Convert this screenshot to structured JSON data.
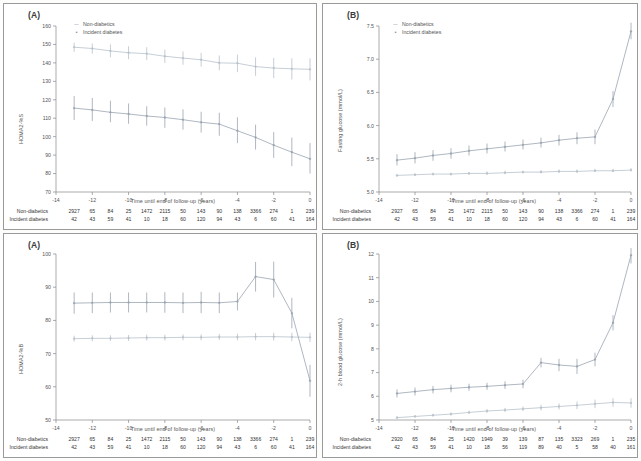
{
  "figure": {
    "legend_labels": [
      "Non-diabetics",
      "Incident diabetes"
    ],
    "xlabel": "Time until end of follow-up (years)",
    "risk_rows": [
      "Non-diabetics",
      "Incident diabetes"
    ],
    "colors": {
      "non_diabetics": "#b8c2cc",
      "incident_diabetes": "#9aa5b1",
      "axis": "#888888"
    }
  },
  "chart_data": [
    {
      "id": "panel-a",
      "type": "line",
      "panel_letter": "(A)",
      "title": "",
      "xlabel": "Time until end of follow-up (years)",
      "ylabel": "HOMA2-%S",
      "xlim": [
        -14,
        0
      ],
      "ylim": [
        70,
        160
      ],
      "yticks": [
        70,
        80,
        90,
        100,
        110,
        120,
        130,
        140,
        150,
        160
      ],
      "xticks": [
        -14,
        -12,
        -10,
        -8,
        -6,
        -4,
        -2,
        0
      ],
      "x": [
        -13,
        -12,
        -11,
        -10,
        -9,
        -8,
        -7,
        -6,
        -5,
        -4,
        -3,
        -2,
        -1,
        0
      ],
      "grid": false,
      "legend_position": "top-left",
      "series": [
        {
          "name": "Non-diabetics",
          "values": [
            148.5,
            147.8,
            146.5,
            145.5,
            145.0,
            143.6,
            142.6,
            141.7,
            140.0,
            139.8,
            138.0,
            137.2,
            136.8,
            136.5
          ],
          "lower": [
            146.0,
            145.0,
            143.0,
            142.0,
            141.5,
            140.0,
            139.0,
            138.0,
            136.0,
            135.0,
            133.0,
            131.8,
            131.0,
            130.5
          ],
          "upper": [
            151.0,
            150.5,
            150.0,
            149.0,
            148.5,
            147.2,
            146.2,
            145.4,
            144.0,
            144.5,
            143.0,
            142.6,
            142.5,
            142.5
          ]
        },
        {
          "name": "Incident diabetes",
          "values": [
            115.5,
            114.5,
            113.2,
            112.3,
            111.2,
            110.4,
            109.2,
            107.8,
            106.8,
            103.2,
            99.6,
            95.4,
            91.6,
            88.0
          ],
          "lower": [
            109.0,
            108.5,
            107.8,
            107.0,
            106.0,
            104.8,
            103.8,
            102.2,
            100.5,
            96.5,
            93.0,
            88.5,
            84.0,
            80.0
          ],
          "upper": [
            122.0,
            121.0,
            119.5,
            118.0,
            116.5,
            115.8,
            114.8,
            113.5,
            113.0,
            110.5,
            106.5,
            102.5,
            99.5,
            96.5
          ]
        }
      ],
      "risk_table": {
        "rows": [
          {
            "label": "Non-diabetics",
            "values": [
              "2927",
              "65",
              "84",
              "25",
              "1472",
              "2115",
              "50",
              "143",
              "90",
              "138",
              "3366",
              "274",
              "1",
              "239"
            ]
          },
          {
            "label": "Incident diabetes",
            "values": [
              "42",
              "43",
              "59",
              "41",
              "10",
              "18",
              "60",
              "120",
              "94",
              "43",
              "6",
              "60",
              "41",
              "164"
            ]
          }
        ]
      }
    },
    {
      "id": "panel-b",
      "type": "line",
      "panel_letter": "(B)",
      "title": "",
      "xlabel": "Time until end of follow-up (years)",
      "ylabel": "Fasting glucose (mmol/L)",
      "xlim": [
        -14,
        0
      ],
      "ylim": [
        5.0,
        7.5
      ],
      "yticks": [
        5.0,
        5.5,
        6.0,
        6.5,
        7.0,
        7.5
      ],
      "xticks": [
        -14,
        -12,
        -10,
        -8,
        -6,
        -4,
        -2,
        0
      ],
      "x": [
        -13,
        -12,
        -11,
        -10,
        -9,
        -8,
        -7,
        -6,
        -5,
        -4,
        -3,
        -2,
        -1,
        0
      ],
      "grid": false,
      "legend_position": "top-left",
      "series": [
        {
          "name": "Non-diabetics",
          "values": [
            5.25,
            5.26,
            5.27,
            5.27,
            5.28,
            5.28,
            5.29,
            5.3,
            5.3,
            5.31,
            5.31,
            5.32,
            5.32,
            5.33
          ],
          "lower": [
            5.23,
            5.24,
            5.25,
            5.25,
            5.26,
            5.26,
            5.27,
            5.28,
            5.28,
            5.29,
            5.29,
            5.3,
            5.3,
            5.31
          ],
          "upper": [
            5.27,
            5.28,
            5.29,
            5.29,
            5.3,
            5.31,
            5.32,
            5.32,
            5.33,
            5.34,
            5.34,
            5.35,
            5.35,
            5.36
          ]
        },
        {
          "name": "Incident diabetes",
          "values": [
            5.48,
            5.51,
            5.55,
            5.58,
            5.62,
            5.65,
            5.68,
            5.71,
            5.74,
            5.78,
            5.81,
            5.83,
            6.4,
            7.42
          ],
          "lower": [
            5.4,
            5.43,
            5.47,
            5.5,
            5.55,
            5.58,
            5.61,
            5.64,
            5.67,
            5.7,
            5.72,
            5.72,
            6.28,
            7.3
          ],
          "upper": [
            5.57,
            5.6,
            5.63,
            5.66,
            5.7,
            5.73,
            5.76,
            5.79,
            5.82,
            5.86,
            5.9,
            5.94,
            6.52,
            7.55
          ]
        }
      ],
      "risk_table": {
        "rows": [
          {
            "label": "Non-diabetics",
            "values": [
              "2927",
              "65",
              "84",
              "25",
              "1472",
              "2115",
              "50",
              "143",
              "90",
              "138",
              "3366",
              "274",
              "1",
              "239"
            ]
          },
          {
            "label": "Incident diabetes",
            "values": [
              "42",
              "43",
              "59",
              "41",
              "10",
              "18",
              "60",
              "120",
              "94",
              "43",
              "6",
              "60",
              "41",
              "164"
            ]
          }
        ]
      }
    },
    {
      "id": "panel-c",
      "type": "line",
      "panel_letter": "(A)",
      "title": "",
      "xlabel": "Time until end of follow-up (years)",
      "ylabel": "HOMA2-%B",
      "xlim": [
        -14,
        0
      ],
      "ylim": [
        50,
        100
      ],
      "yticks": [
        50,
        60,
        70,
        80,
        90,
        100
      ],
      "xticks": [
        -14,
        -12,
        -10,
        -8,
        -6,
        -4,
        -2,
        0
      ],
      "x": [
        -13,
        -12,
        -11,
        -10,
        -9,
        -8,
        -7,
        -6,
        -5,
        -4,
        -3,
        -2,
        -1,
        0
      ],
      "grid": false,
      "legend_position": "none",
      "series": [
        {
          "name": "Non-diabetics",
          "values": [
            74.5,
            74.6,
            74.6,
            74.7,
            74.8,
            74.8,
            74.9,
            74.9,
            75.0,
            75.0,
            75.1,
            75.1,
            75.0,
            74.9
          ],
          "lower": [
            73.6,
            73.7,
            73.8,
            73.8,
            73.9,
            73.9,
            74.0,
            74.0,
            74.1,
            74.0,
            74.0,
            73.9,
            73.7,
            73.5
          ],
          "upper": [
            75.4,
            75.5,
            75.5,
            75.6,
            75.7,
            75.7,
            75.8,
            75.8,
            75.9,
            76.0,
            76.2,
            76.3,
            76.3,
            76.3
          ]
        },
        {
          "name": "Incident diabetes",
          "values": [
            85.2,
            85.3,
            85.4,
            85.4,
            85.4,
            85.4,
            85.3,
            85.4,
            85.3,
            85.7,
            93.2,
            92.3,
            82.2,
            61.8
          ],
          "lower": [
            82.0,
            82.2,
            82.4,
            82.4,
            82.4,
            82.3,
            82.2,
            82.2,
            82.2,
            83.0,
            88.7,
            86.9,
            77.6,
            57.0
          ],
          "upper": [
            88.4,
            88.4,
            88.4,
            88.4,
            88.4,
            88.5,
            88.4,
            88.6,
            88.4,
            88.4,
            97.6,
            97.7,
            86.8,
            66.6
          ]
        }
      ],
      "risk_table": {
        "rows": [
          {
            "label": "Non-diabetics",
            "values": [
              "2927",
              "65",
              "84",
              "25",
              "1472",
              "2115",
              "50",
              "143",
              "90",
              "138",
              "3366",
              "274",
              "1",
              "239"
            ]
          },
          {
            "label": "Incident diabetes",
            "values": [
              "42",
              "43",
              "59",
              "41",
              "10",
              "18",
              "60",
              "120",
              "94",
              "43",
              "6",
              "60",
              "41",
              "164"
            ]
          }
        ]
      }
    },
    {
      "id": "panel-d",
      "type": "line",
      "panel_letter": "(B)",
      "title": "",
      "xlabel": "Time until end of follow-up (years)",
      "ylabel": "2-h blood glucose (mmol/L)",
      "xlim": [
        -14,
        0
      ],
      "ylim": [
        5,
        12
      ],
      "yticks": [
        5,
        6,
        7,
        8,
        9,
        10,
        11,
        12
      ],
      "xticks": [
        -14,
        -12,
        -10,
        -8,
        -6,
        -4,
        -2,
        0
      ],
      "x": [
        -13,
        -12,
        -11,
        -10,
        -9,
        -8,
        -7,
        -6,
        -5,
        -4,
        -3,
        -2,
        -1,
        0
      ],
      "grid": false,
      "legend_position": "none",
      "series": [
        {
          "name": "Non-diabetics",
          "values": [
            5.1,
            5.15,
            5.2,
            5.25,
            5.32,
            5.38,
            5.42,
            5.47,
            5.52,
            5.57,
            5.62,
            5.68,
            5.74,
            5.72
          ],
          "lower": [
            5.05,
            5.1,
            5.15,
            5.19,
            5.25,
            5.3,
            5.34,
            5.38,
            5.4,
            5.44,
            5.46,
            5.5,
            5.56,
            5.52
          ],
          "upper": [
            5.16,
            5.21,
            5.26,
            5.32,
            5.39,
            5.46,
            5.51,
            5.57,
            5.64,
            5.7,
            5.78,
            5.86,
            5.92,
            5.92
          ]
        },
        {
          "name": "Incident diabetes",
          "values": [
            6.12,
            6.2,
            6.28,
            6.33,
            6.38,
            6.42,
            6.47,
            6.52,
            7.42,
            7.32,
            7.26,
            7.55,
            9.1,
            11.95
          ],
          "lower": [
            5.95,
            6.03,
            6.12,
            6.17,
            6.23,
            6.27,
            6.31,
            6.34,
            7.22,
            7.06,
            6.94,
            7.26,
            8.78,
            11.6
          ],
          "upper": [
            6.29,
            6.37,
            6.44,
            6.49,
            6.53,
            6.57,
            6.63,
            6.7,
            7.62,
            7.58,
            7.58,
            7.84,
            9.42,
            12.25
          ]
        }
      ],
      "risk_table": {
        "rows": [
          {
            "label": "Non-diabetics",
            "values": [
              "2920",
              "65",
              "84",
              "25",
              "1420",
              "1949",
              "39",
              "139",
              "87",
              "135",
              "3323",
              "269",
              "1",
              "235"
            ]
          },
          {
            "label": "Incident diabetes",
            "values": [
              "42",
              "43",
              "59",
              "41",
              "10",
              "18",
              "56",
              "119",
              "89",
              "40",
              "5",
              "58",
              "40",
              "161"
            ]
          }
        ]
      }
    }
  ]
}
